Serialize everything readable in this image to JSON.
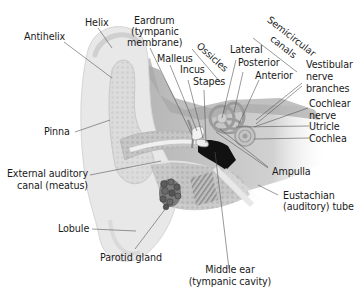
{
  "diagram": {
    "labels": {
      "helix": "Helix",
      "antihelix": "Antihelix",
      "eardrum_1": "Eardrum",
      "eardrum_2": "(tympanic",
      "eardrum_3": "membrane)",
      "malleus": "Malleus",
      "incus": "Incus",
      "stapes": "Stapes",
      "ossicles": "Ossicles",
      "lateral": "Lateral",
      "posterior": "Posterior",
      "anterior": "Anterior",
      "semicircular_1": "Semicircular",
      "semicircular_2": "canals",
      "vestibular_1": "Vestibular",
      "vestibular_2": "nerve",
      "vestibular_3": "branches",
      "cochlear_nerve_1": "Cochlear",
      "cochlear_nerve_2": "nerve",
      "utricle": "Utricle",
      "cochlea": "Cochlea",
      "ampulla": "Ampulla",
      "eustachian_1": "Eustachian",
      "eustachian_2": "(auditory) tube",
      "pinna": "Pinna",
      "external_canal_1": "External auditory",
      "external_canal_2": "canal (meatus)",
      "lobule": "Lobule",
      "parotid": "Parotid gland",
      "middle_ear_1": "Middle ear",
      "middle_ear_2": "(tympanic cavity)"
    },
    "colors": {
      "outer_ear": "#e6e6e6",
      "outer_ear_inner": "#d4d4d4",
      "bone": "#bdbdbd",
      "bone_dark": "#a3a3a3",
      "cavity": "#111111",
      "gland": "#6e6e6e",
      "leader": "#555555",
      "text": "#1a1a1a"
    }
  }
}
